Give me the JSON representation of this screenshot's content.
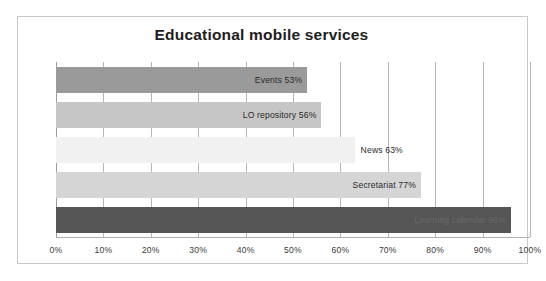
{
  "chart_data": {
    "type": "bar",
    "orientation": "horizontal",
    "title": "Educational mobile services",
    "xlabel": "",
    "ylabel": "",
    "xlim": [
      0,
      100
    ],
    "grid": true,
    "legend": "none",
    "categories": [
      "Events",
      "LO repository",
      "News",
      "Secretariat",
      "Learning calendar"
    ],
    "values": [
      53,
      56,
      63,
      77,
      96
    ],
    "data_labels": [
      "Events 53%",
      "LO repository  56%",
      "News 63%",
      "Secretariat 77%",
      "Learning calendar  96%"
    ],
    "bar_colors": [
      "#9a9a9a",
      "#c6c6c6",
      "#f1f1f1",
      "#d5d5d5",
      "#555555"
    ],
    "label_inside": [
      true,
      true,
      false,
      true,
      true
    ],
    "x_ticks": [
      "0%",
      "10%",
      "20%",
      "30%",
      "40%",
      "50%",
      "60%",
      "70%",
      "80%",
      "90%",
      "100%"
    ],
    "x_tick_values": [
      0,
      10,
      20,
      30,
      40,
      50,
      60,
      70,
      80,
      90,
      100
    ]
  },
  "frame": {
    "border_color": "#c9c9c9",
    "background": "#ffffff"
  }
}
